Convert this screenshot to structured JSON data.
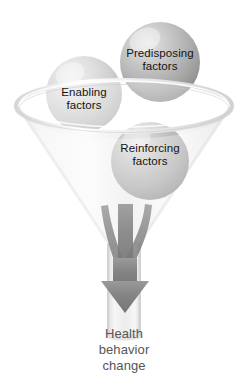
{
  "diagram": {
    "background_color": "#ffffff"
  },
  "funnel": {
    "name": "glass-funnel",
    "body_color": "#f2f2f2",
    "rim_color": "#e4e4e4",
    "stem_color": "#ececec"
  },
  "spheres": [
    {
      "id": "predisposing",
      "label_line1": "Predisposing",
      "label_line2": "factors",
      "fill_color": "#b4b4b4",
      "highlight_color": "#e0e0e0",
      "cx": 160,
      "cy": 62,
      "r": 40
    },
    {
      "id": "enabling",
      "label_line1": "Enabling",
      "label_line2": "factors",
      "fill_color": "#d2d2d2",
      "highlight_color": "#ededed",
      "cx": 84,
      "cy": 94,
      "r": 38
    },
    {
      "id": "reinforcing",
      "label_line1": "Reinforcing",
      "label_line2": "factors",
      "fill_color": "#b9b9b9",
      "highlight_color": "#dcdcdc",
      "cx": 150,
      "cy": 161,
      "r": 39
    }
  ],
  "arrow": {
    "name": "convergence-arrow",
    "color": "#7c7c7c",
    "stream_count": 3
  },
  "outcome": {
    "line1": "Health",
    "line2": "behavior",
    "line3": "change",
    "text_color": "#565656"
  }
}
